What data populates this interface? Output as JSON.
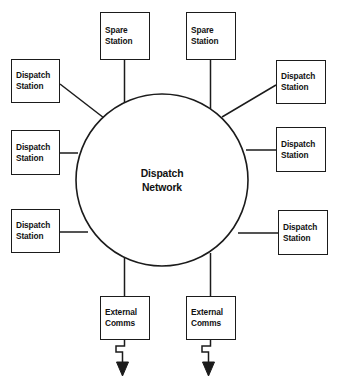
{
  "diagram": {
    "type": "network-topology",
    "title": "Dispatch Network",
    "background_color": "#ffffff",
    "stroke_color": "#1b1b1b",
    "text_color": "#111111",
    "hub": {
      "name": "dispatch-network-hub",
      "shape": "circle",
      "label_line1": "Dispatch",
      "label_line2": "Network"
    },
    "nodes": [
      {
        "id": "spare-station-left",
        "line1": "Spare",
        "line2": "Station",
        "position": "top-left",
        "connector": "vertical"
      },
      {
        "id": "spare-station-right",
        "line1": "Spare",
        "line2": "Station",
        "position": "top-right",
        "connector": "vertical"
      },
      {
        "id": "dispatch-station-upper-left",
        "line1": "Dispatch",
        "line2": "Station",
        "position": "upper-left",
        "connector": "diagonal"
      },
      {
        "id": "dispatch-station-middle-left",
        "line1": "Dispatch",
        "line2": "Station",
        "position": "middle-left",
        "connector": "horizontal"
      },
      {
        "id": "dispatch-station-lower-left",
        "line1": "Dispatch",
        "line2": "Station",
        "position": "lower-left",
        "connector": "horizontal"
      },
      {
        "id": "dispatch-station-upper-right",
        "line1": "Dispatch",
        "line2": "Station",
        "position": "upper-right",
        "connector": "diagonal"
      },
      {
        "id": "dispatch-station-middle-right",
        "line1": "Dispatch",
        "line2": "Station",
        "position": "middle-right",
        "connector": "horizontal"
      },
      {
        "id": "dispatch-station-lower-right",
        "line1": "Dispatch",
        "line2": "Station",
        "position": "lower-right",
        "connector": "horizontal"
      },
      {
        "id": "external-comms-left",
        "line1": "External",
        "line2": "Comms",
        "position": "bottom-left",
        "connector": "vertical",
        "outbound": "zigzag-arrow-down"
      },
      {
        "id": "external-comms-right",
        "line1": "External",
        "line2": "Comms",
        "position": "bottom-right",
        "connector": "vertical",
        "outbound": "zigzag-arrow-down"
      }
    ]
  }
}
